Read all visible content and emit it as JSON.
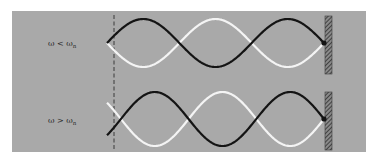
{
  "colors": {
    "page_background": "#ffffff",
    "panel_background": "#a9a9a9",
    "wave_dark": "#141414",
    "wave_light": "#f4f4f4",
    "dashed_line": "#3a3a3a",
    "wall": "#3c3c3c"
  },
  "panels": [
    {
      "id": "top",
      "label_main": "ω < ω",
      "label_sub": "n",
      "description": "Driven string below natural frequency: wave fixed at the wall with a node at the dashed driving position"
    },
    {
      "id": "bottom",
      "label_main": "ω > ω",
      "label_sub": "n",
      "description": "Driven string above natural frequency: wave fixed at the wall, driving position offset from a node"
    }
  ]
}
